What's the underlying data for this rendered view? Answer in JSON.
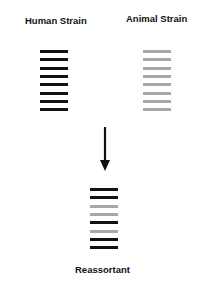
{
  "labels": {
    "human": "Human Strain",
    "animal": "Animal Strain",
    "reassortant": "Reassortant"
  },
  "colors": {
    "human_segment": "#111111",
    "animal_segment": "#a8a8a8",
    "arrow": "#111111"
  },
  "strains": {
    "human": {
      "segments": [
        "human",
        "human",
        "human",
        "human",
        "human",
        "human",
        "human",
        "human"
      ]
    },
    "animal": {
      "segments": [
        "animal",
        "animal",
        "animal",
        "animal",
        "animal",
        "animal",
        "animal",
        "animal"
      ]
    },
    "reassortant": {
      "segments": [
        "human",
        "human",
        "animal",
        "animal",
        "human",
        "animal",
        "human",
        "human"
      ]
    }
  }
}
